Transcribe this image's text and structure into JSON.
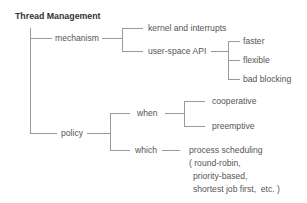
{
  "title": "Thread Management",
  "nodes": {
    "mechanism": "mechanism",
    "kernel": "kernel and interrupts",
    "user_space": "user-space API",
    "faster": "faster",
    "flexible": "flexible",
    "bad_blocking": "bad blocking",
    "policy": "policy",
    "when": "when",
    "cooperative": "cooperative",
    "preemptive": "preemptive",
    "which": "which",
    "process_scheduling": [
      "process scheduling",
      "( round-robin,",
      "priority-based,",
      "shortest job first,  etc. )"
    ]
  },
  "colors": {
    "line": "#9a9a9a",
    "text": "#555555",
    "title": "#333333"
  }
}
